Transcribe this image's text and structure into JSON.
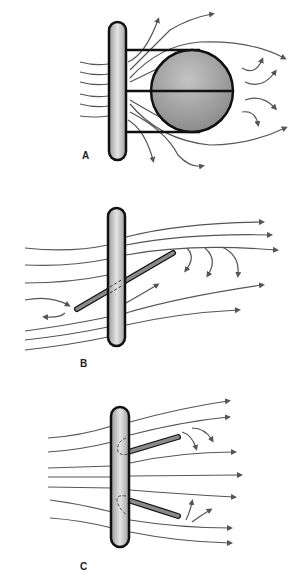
{
  "figure": {
    "panels": [
      {
        "id": "A",
        "label": "A",
        "description": "Vertical post with attached sphere; flow diverges around sphere producing wake vortices"
      },
      {
        "id": "B",
        "label": "B",
        "description": "Vertical post with single diagonal strut; flow deflected with downwash vortices behind strut"
      },
      {
        "id": "C",
        "label": "C",
        "description": "Vertical post with two angled struts; small vortices behind strut tips, flow mostly straight"
      }
    ],
    "colors": {
      "post_fill": "#c8c8c8",
      "sphere_fill": "#9a9a9a",
      "strut_fill": "#8a8a8a",
      "line": "#555555",
      "outline": "#111111",
      "arrow": "#555555"
    }
  }
}
